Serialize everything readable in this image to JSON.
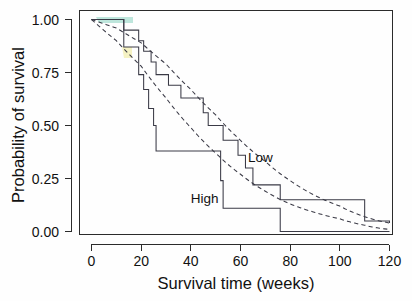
{
  "figure": {
    "background_color": "#fefefe",
    "ink_color": "#2b2b2b",
    "curve_color": "#3a3a46"
  },
  "chart_data": {
    "type": "line",
    "title": "",
    "subtitle": "",
    "xlabel": "Survival time (weeks)",
    "ylabel": "Probability of survival",
    "xlim": [
      0,
      120
    ],
    "ylim": [
      0.0,
      1.0
    ],
    "xticks": [
      0,
      20,
      40,
      60,
      80,
      100,
      120
    ],
    "xticklabels": [
      "0",
      "20",
      "40",
      "60",
      "80",
      "100",
      "120"
    ],
    "yticks": [
      0.0,
      0.25,
      0.5,
      0.75,
      1.0
    ],
    "yticklabels": [
      "0.00",
      "0.25",
      "0.50",
      "0.75",
      "1.00"
    ],
    "grid": false,
    "legend": "inline-annotations",
    "annotations": [
      {
        "text": "Low",
        "x": 63,
        "y": 0.33
      },
      {
        "text": "High",
        "x": 40,
        "y": 0.135
      }
    ],
    "series": [
      {
        "name": "Low",
        "style": "kaplan-meier-step",
        "dash": false,
        "x": [
          0,
          11,
          13,
          19,
          21,
          24,
          26,
          31,
          36,
          41,
          45,
          47,
          53,
          56,
          59,
          62,
          65,
          74,
          76,
          103,
          110,
          120
        ],
        "y": [
          1.0,
          1.0,
          0.95,
          0.9,
          0.85,
          0.8,
          0.74,
          0.69,
          0.63,
          0.63,
          0.56,
          0.5,
          0.43,
          0.43,
          0.36,
          0.3,
          0.22,
          0.22,
          0.15,
          0.15,
          0.05,
          0.04
        ]
      },
      {
        "name": "High",
        "style": "kaplan-meier-step",
        "dash": false,
        "x": [
          0,
          10,
          13,
          19,
          21,
          23,
          25,
          26,
          48,
          52,
          53,
          75,
          76,
          120
        ],
        "y": [
          1.0,
          1.0,
          0.87,
          0.74,
          0.67,
          0.58,
          0.5,
          0.38,
          0.38,
          0.24,
          0.11,
          0.11,
          0.0,
          0.0
        ]
      },
      {
        "name": "Low fitted",
        "style": "fitted-exponential",
        "dash": true,
        "description": "Smooth dashed fit to the Low group",
        "x": [
          0,
          10,
          20,
          30,
          40,
          50,
          60,
          70,
          80,
          90,
          100,
          110,
          120
        ],
        "y": [
          1.0,
          0.96,
          0.89,
          0.79,
          0.67,
          0.55,
          0.43,
          0.33,
          0.24,
          0.17,
          0.12,
          0.07,
          0.04
        ]
      },
      {
        "name": "High fitted",
        "style": "fitted-exponential",
        "dash": true,
        "description": "Smooth dashed fit to the High group",
        "x": [
          0,
          10,
          20,
          30,
          40,
          50,
          60,
          70,
          80,
          90,
          100,
          110,
          120
        ],
        "y": [
          1.0,
          0.9,
          0.78,
          0.63,
          0.49,
          0.37,
          0.27,
          0.19,
          0.13,
          0.09,
          0.06,
          0.03,
          0.01
        ]
      }
    ]
  }
}
